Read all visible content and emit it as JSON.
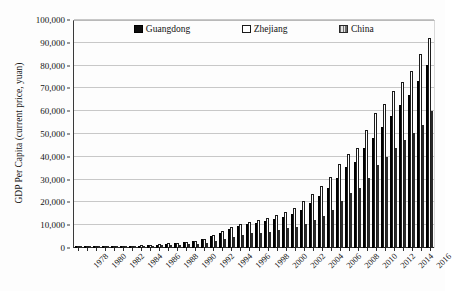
{
  "chart_data": {
    "type": "bar",
    "title": "",
    "xlabel": "",
    "ylabel": "GDP Per Capita (current price, yuan)",
    "ylim": [
      0,
      100000
    ],
    "ytick_values": [
      0,
      10000,
      20000,
      30000,
      40000,
      50000,
      60000,
      70000,
      80000,
      90000,
      100000
    ],
    "ytick_labels": [
      "0",
      "10,000",
      "20,000",
      "30,000",
      "40,000",
      "50,000",
      "60,000",
      "70,000",
      "80,000",
      "90,000",
      "100,000"
    ],
    "grid": true,
    "legend_position": "top-center",
    "bar_grouping": "grouped",
    "categories": [
      "1978",
      "1979",
      "1980",
      "1981",
      "1982",
      "1983",
      "1984",
      "1985",
      "1986",
      "1987",
      "1988",
      "1989",
      "1990",
      "1991",
      "1992",
      "1993",
      "1994",
      "1995",
      "1996",
      "1997",
      "1998",
      "1999",
      "2000",
      "2001",
      "2002",
      "2003",
      "2004",
      "2005",
      "2006",
      "2007",
      "2008",
      "2009",
      "2010",
      "2011",
      "2012",
      "2013",
      "2014",
      "2015",
      "2016",
      "2017"
    ],
    "xtick_labels": [
      "1978",
      "1980",
      "1982",
      "1984",
      "1986",
      "1988",
      "1990",
      "1992",
      "1994",
      "1996",
      "1998",
      "2000",
      "2002",
      "2004",
      "2006",
      "2008",
      "2010",
      "2012",
      "2014",
      "2016"
    ],
    "series": [
      {
        "name": "Guangdong",
        "style": "solid-black",
        "color": "#0d0d0d",
        "values": [
          370,
          410,
          480,
          530,
          600,
          680,
          840,
          1060,
          1210,
          1470,
          1870,
          2120,
          2480,
          2920,
          3780,
          5060,
          6780,
          8230,
          9490,
          10450,
          11120,
          11810,
          12760,
          13730,
          14910,
          16880,
          19630,
          22640,
          26380,
          30680,
          35420,
          37640,
          43660,
          48280,
          53080,
          57780,
          62510,
          66936,
          73290,
          80310
        ]
      },
      {
        "name": "Zhejiang",
        "style": "hollow-white",
        "color": "#ffffff",
        "values": [
          331,
          375,
          470,
          530,
          610,
          690,
          880,
          1170,
          1390,
          1680,
          2150,
          2390,
          2670,
          3170,
          4120,
          5630,
          7400,
          9190,
          10500,
          11580,
          12400,
          13250,
          14550,
          15970,
          17750,
          20420,
          23860,
          27060,
          31160,
          36680,
          41440,
          43860,
          51770,
          59310,
          63310,
          68790,
          73000,
          77644,
          84916,
          92057
        ]
      },
      {
        "name": "China",
        "style": "gray-hatched",
        "color": "#9a9a9a",
        "values": [
          385,
          423,
          468,
          497,
          533,
          588,
          695,
          858,
          963,
          1112,
          1366,
          1519,
          1644,
          1893,
          2311,
          2998,
          4044,
          5046,
          5846,
          6420,
          6796,
          7159,
          7858,
          8622,
          9398,
          10542,
          12336,
          14053,
          16500,
          20494,
          24100,
          26180,
          30808,
          36302,
          39874,
          43852,
          47203,
          50251,
          53980,
          60014
        ]
      }
    ]
  },
  "legend": {
    "items": [
      {
        "label": "Guangdong"
      },
      {
        "label": "Zhejiang"
      },
      {
        "label": "China"
      }
    ]
  },
  "bleed_text": {
    "line1": "",
    "line2": "",
    "line3": "",
    "line4": "",
    "line5": ""
  }
}
